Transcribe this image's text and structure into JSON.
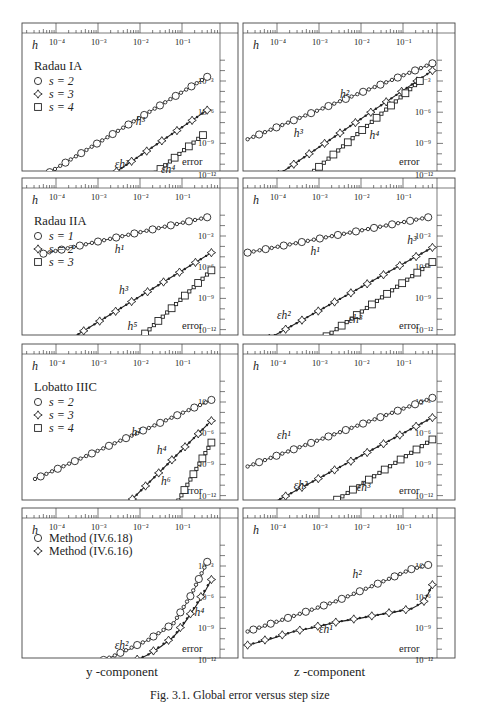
{
  "figure": {
    "caption": "Fig. 3.1. Global error versus step size",
    "column_labels": {
      "left": "y -component",
      "right": "z -component"
    },
    "axis": {
      "h_label": "h",
      "error_label": "error",
      "h_ticks": [
        "10⁻⁴",
        "10⁻³",
        "10⁻²",
        "10⁻¹"
      ],
      "error_ticks": [
        "10⁻³",
        "10⁻⁶",
        "10⁻⁹",
        "10⁻¹²"
      ]
    }
  },
  "chart_data": [
    {
      "type": "line",
      "title": "Radau IA",
      "component": "y",
      "xlabel": "h",
      "ylabel": "error",
      "xscale": "log",
      "yscale": "log",
      "xlim": [
        1e-05,
        1
      ],
      "ylim": [
        1e-14,
        0.1
      ],
      "legend": [
        "s = 2",
        "s = 3",
        "s = 4"
      ],
      "series": [
        {
          "name": "s = 2",
          "marker": "circle",
          "x_log": [
            -4.9,
            -0.4
          ],
          "y_log": [
            -13.6,
            -2.6
          ],
          "annotation": "h³",
          "ann_pos": [
            -2.1,
            -7.2
          ]
        },
        {
          "name": "s = 3",
          "marker": "star",
          "x_log": [
            -3.4,
            -0.4
          ],
          "y_log": [
            -14.0,
            -5.8
          ],
          "annotation": "εh³",
          "ann_pos": [
            -2.6,
            -11.4
          ]
        },
        {
          "name": "s = 4",
          "marker": "square",
          "x_log": [
            -2.3,
            -0.5
          ],
          "y_log": [
            -14.0,
            -8.2
          ],
          "annotation": "εh⁴",
          "ann_pos": [
            -1.5,
            -11.8
          ]
        }
      ]
    },
    {
      "type": "line",
      "title": "",
      "component": "z",
      "xlabel": "h",
      "ylabel": "error",
      "xscale": "log",
      "yscale": "log",
      "xlim": [
        1e-05,
        1
      ],
      "ylim": [
        1e-14,
        0.1
      ],
      "series": [
        {
          "name": "s = 2",
          "marker": "circle",
          "x_log": [
            -4.7,
            -0.3
          ],
          "y_log": [
            -8.6,
            -1.3
          ],
          "annotation": "h²",
          "ann_pos": [
            -2.5,
            -4.6
          ]
        },
        {
          "name": "s = 3",
          "marker": "star",
          "x_log": [
            -4.7,
            -0.3
          ],
          "y_log": [
            -14.0,
            -2.0
          ],
          "annotation": "h³",
          "ann_pos": [
            -3.6,
            -8.4
          ]
        },
        {
          "name": "s = 4",
          "marker": "square",
          "x_log": [
            -3.8,
            -0.6
          ],
          "y_log": [
            -14.0,
            -3.0
          ],
          "annotation": "h⁴",
          "ann_pos": [
            -1.8,
            -8.6
          ]
        }
      ]
    },
    {
      "type": "line",
      "title": "Radau IIA",
      "component": "y",
      "xlabel": "h",
      "ylabel": "error",
      "xscale": "log",
      "yscale": "log",
      "xlim": [
        1e-05,
        1
      ],
      "ylim": [
        1e-14,
        0.1
      ],
      "legend": [
        "s = 1",
        "s = 2",
        "s = 3"
      ],
      "series": [
        {
          "name": "s = 1",
          "marker": "circle",
          "x_log": [
            -4.3,
            -0.4
          ],
          "y_log": [
            -4.7,
            -1.2
          ],
          "annotation": "h¹",
          "ann_pos": [
            -2.6,
            -4.6
          ]
        },
        {
          "name": "s = 2",
          "marker": "star",
          "x_log": [
            -4.1,
            -0.3
          ],
          "y_log": [
            -14.0,
            -4.6
          ],
          "annotation": "h³",
          "ann_pos": [
            -2.5,
            -8.6
          ]
        },
        {
          "name": "s = 3",
          "marker": "square",
          "x_log": [
            -2.3,
            -0.3
          ],
          "y_log": [
            -14.0,
            -6.3
          ],
          "annotation": "h⁵",
          "ann_pos": [
            -2.3,
            -12.0
          ]
        }
      ]
    },
    {
      "type": "line",
      "title": "",
      "component": "z",
      "xlabel": "h",
      "ylabel": "error",
      "xscale": "log",
      "yscale": "log",
      "xlim": [
        1e-05,
        1
      ],
      "ylim": [
        1e-14,
        0.1
      ],
      "series": [
        {
          "name": "s = 1",
          "marker": "circle",
          "x_log": [
            -4.7,
            -0.4
          ],
          "y_log": [
            -4.6,
            -1.2
          ],
          "annotation": "h¹",
          "ann_pos": [
            -3.2,
            -4.8
          ]
        },
        {
          "name": "s = 2",
          "marker": "star",
          "x_log": [
            -4.7,
            -0.3
          ],
          "y_log": [
            -14.0,
            -4.1
          ],
          "annotation": "h³",
          "ann_pos": [
            -0.9,
            -3.8
          ]
        },
        {
          "name": "s = 3",
          "marker": "square",
          "x_log": [
            -3.3,
            -0.3
          ],
          "y_log": [
            -14.0,
            -5.5
          ],
          "annotation": "εh²",
          "ann_pos": [
            -4.0,
            -11.0
          ]
        },
        {
          "name": "s = 3 (label)",
          "marker": "none",
          "x_log": [],
          "y_log": [],
          "annotation": "εh³",
          "ann_pos": [
            -2.3,
            -11.4
          ]
        }
      ]
    },
    {
      "type": "line",
      "title": "Lobatto IIIC",
      "component": "y",
      "xlabel": "h",
      "ylabel": "error",
      "xscale": "log",
      "yscale": "log",
      "xlim": [
        1e-05,
        1
      ],
      "ylim": [
        1e-14,
        0.1
      ],
      "legend": [
        "s = 2",
        "s = 3",
        "s = 4"
      ],
      "series": [
        {
          "name": "s = 2",
          "marker": "circle",
          "x_log": [
            -4.5,
            -0.3
          ],
          "y_log": [
            -10.4,
            -2.8
          ],
          "annotation": "h²",
          "ann_pos": [
            -2.2,
            -6.3
          ]
        },
        {
          "name": "s = 3",
          "marker": "star",
          "x_log": [
            -2.6,
            -0.3
          ],
          "y_log": [
            -14.0,
            -4.8
          ],
          "annotation": "h⁴",
          "ann_pos": [
            -1.6,
            -8.0
          ]
        },
        {
          "name": "s = 4",
          "marker": "square",
          "x_log": [
            -1.3,
            -0.3
          ],
          "y_log": [
            -14.0,
            -6.9
          ],
          "annotation": "h⁶",
          "ann_pos": [
            -1.5,
            -11.0
          ]
        }
      ]
    },
    {
      "type": "line",
      "title": "",
      "component": "z",
      "xlabel": "h",
      "ylabel": "error",
      "xscale": "log",
      "yscale": "log",
      "xlim": [
        1e-05,
        1
      ],
      "ylim": [
        1e-14,
        0.1
      ],
      "series": [
        {
          "name": "s = 2",
          "marker": "circle",
          "x_log": [
            -4.7,
            -0.3
          ],
          "y_log": [
            -9.2,
            -2.6
          ],
          "annotation": "εh¹",
          "ann_pos": [
            -4.0,
            -6.6
          ]
        },
        {
          "name": "s = 3",
          "marker": "star",
          "x_log": [
            -4.7,
            -0.3
          ],
          "y_log": [
            -14.0,
            -4.5
          ],
          "annotation": "εh²",
          "ann_pos": [
            -3.6,
            -11.4
          ]
        },
        {
          "name": "s = 4",
          "marker": "square",
          "x_log": [
            -3.2,
            -0.3
          ],
          "y_log": [
            -14.0,
            -6.6
          ],
          "annotation": "εh³",
          "ann_pos": [
            -2.1,
            -11.6
          ]
        }
      ]
    },
    {
      "type": "line",
      "title": "",
      "component": "y",
      "xlabel": "h",
      "ylabel": "error",
      "xscale": "log",
      "yscale": "log",
      "xlim": [
        1e-05,
        1
      ],
      "ylim": [
        1e-14,
        0.1
      ],
      "legend": [
        "Method (IV.6.18)",
        "Method (IV.6.16)"
      ],
      "series": [
        {
          "name": "Method (IV.6.18)",
          "marker": "circle",
          "curve": true,
          "pts": [
            [
              -4.0,
              -13.9
            ],
            [
              -3.4,
              -12.9
            ],
            [
              -2.6,
              -11.6
            ],
            [
              -1.8,
              -10.1
            ],
            [
              -1.2,
              -8.5
            ],
            [
              -0.8,
              -5.9
            ],
            [
              -0.4,
              -2.6
            ]
          ],
          "annotation": "εh²",
          "ann_pos": [
            -2.6,
            -11.0
          ]
        },
        {
          "name": "Method (IV.6.16)",
          "marker": "star",
          "curve": true,
          "pts": [
            [
              -3.4,
              -14.0
            ],
            [
              -2.6,
              -12.9
            ],
            [
              -1.8,
              -11.5
            ],
            [
              -1.2,
              -9.8
            ],
            [
              -0.8,
              -7.6
            ],
            [
              -0.3,
              -4.3
            ]
          ],
          "annotation": "h⁴",
          "ann_pos": [
            -0.7,
            -7.8
          ]
        }
      ]
    },
    {
      "type": "line",
      "title": "",
      "component": "z",
      "xlabel": "h",
      "ylabel": "error",
      "xscale": "log",
      "yscale": "log",
      "xlim": [
        1e-05,
        1
      ],
      "ylim": [
        1e-14,
        0.1
      ],
      "series": [
        {
          "name": "Method (IV.6.18)",
          "marker": "circle",
          "curve": true,
          "pts": [
            [
              -4.7,
              -9.3
            ],
            [
              -3.6,
              -7.8
            ],
            [
              -2.6,
              -6.4
            ],
            [
              -1.6,
              -4.7
            ],
            [
              -0.8,
              -3.3
            ],
            [
              -0.4,
              -2.9
            ]
          ],
          "annotation": "h²",
          "ann_pos": [
            -2.2,
            -4.2
          ]
        },
        {
          "name": "Method (IV.6.16)",
          "marker": "star",
          "curve": true,
          "pts": [
            [
              -4.7,
              -10.6
            ],
            [
              -3.6,
              -9.3
            ],
            [
              -2.6,
              -8.4
            ],
            [
              -1.6,
              -7.7
            ],
            [
              -0.8,
              -7.1
            ],
            [
              -0.5,
              -6.4
            ],
            [
              -0.3,
              -4.8
            ]
          ],
          "annotation": "εh¹",
          "ann_pos": [
            -3.0,
            -9.4
          ]
        }
      ]
    }
  ]
}
